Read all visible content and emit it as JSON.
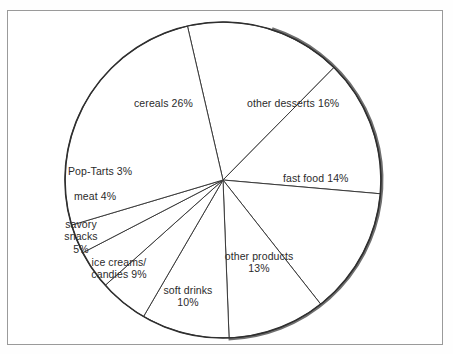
{
  "figure": {
    "background_color": "#ffffff",
    "frame_color": "#9a9a9a",
    "outline_color": "#2f2f2f",
    "shadow_color": "#6f6f6f",
    "label_color": "#2b2b2b"
  },
  "chart_data": {
    "type": "pie",
    "title": "",
    "subtitle": "",
    "xlabel": "",
    "ylabel": "",
    "legend_position": "none",
    "grid": false,
    "start_angle_deg": -13,
    "direction": "clockwise",
    "units": "percent",
    "total": 100,
    "categories": [
      "other desserts",
      "fast food",
      "other products",
      "soft drinks",
      "ice creams/candies",
      "savory snacks",
      "meat",
      "Pop-Tarts",
      "cereals"
    ],
    "values": [
      16,
      14,
      13,
      10,
      9,
      5,
      4,
      3,
      26
    ],
    "slices": [
      {
        "name": "other desserts",
        "value": 16,
        "label_line1": "other desserts 16%",
        "label_line2": "",
        "label_x": 247,
        "label_y": 97,
        "align": "left"
      },
      {
        "name": "fast food",
        "value": 14,
        "label_line1": "fast food 14%",
        "label_line2": "",
        "label_x": 283,
        "label_y": 172,
        "align": "left"
      },
      {
        "name": "other products",
        "value": 13,
        "label_line1": "other products",
        "label_line2": "13%",
        "label_x": 259,
        "label_y": 250,
        "align": "center"
      },
      {
        "name": "soft drinks",
        "value": 10,
        "label_line1": "soft drinks",
        "label_line2": "10%",
        "label_x": 188,
        "label_y": 284,
        "align": "center"
      },
      {
        "name": "ice creams/candies",
        "value": 9,
        "label_line1": "ice creams/",
        "label_line2": "candies 9%",
        "label_x": 119,
        "label_y": 256,
        "align": "center"
      },
      {
        "name": "savory snacks",
        "value": 5,
        "label_line1": "savory",
        "label_line2": "snacks",
        "label_line3": "5%",
        "label_x": 81,
        "label_y": 218,
        "align": "center"
      },
      {
        "name": "meat",
        "value": 4,
        "label_line1": "meat 4%",
        "label_line2": "",
        "label_x": 74,
        "label_y": 190,
        "align": "left"
      },
      {
        "name": "Pop-Tarts",
        "value": 3,
        "label_line1": "Pop-Tarts 3%",
        "label_line2": "",
        "label_x": 68,
        "label_y": 165,
        "align": "left"
      },
      {
        "name": "cereals",
        "value": 26,
        "label_line1": "cereals 26%",
        "label_line2": "",
        "label_x": 134,
        "label_y": 97,
        "align": "left"
      }
    ]
  }
}
